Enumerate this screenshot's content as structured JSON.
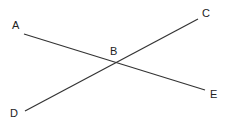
{
  "diagram": {
    "type": "intersecting-lines",
    "points": {
      "A": {
        "label": "A",
        "x": 24,
        "y": 34
      },
      "B": {
        "label": "B",
        "x": 116,
        "y": 63
      },
      "C": {
        "label": "C",
        "x": 198,
        "y": 19
      },
      "D": {
        "label": "D",
        "x": 25,
        "y": 111
      },
      "E": {
        "label": "E",
        "x": 205,
        "y": 90
      }
    },
    "segments": [
      {
        "from": "A",
        "to": "E"
      },
      {
        "from": "D",
        "to": "C"
      }
    ],
    "line_color": "#333333"
  }
}
